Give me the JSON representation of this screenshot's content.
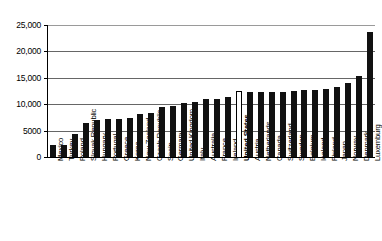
{
  "chart_data": {
    "type": "bar",
    "title": "",
    "subtitle": "",
    "xlabel": "",
    "ylabel": "",
    "ylim": [
      0,
      25000
    ],
    "yticks": [
      0,
      5000,
      10000,
      15000,
      20000,
      25000
    ],
    "ytick_labels": [
      "0",
      "5000",
      "10,000",
      "15,000",
      "20,000",
      "25,000"
    ],
    "grid": true,
    "legend": "none",
    "highlight_category": "United States",
    "highlight_style": "hollow-white-bar-with-black-outline",
    "bar_color": "#111111",
    "highlight_bar_color": "#ffffff",
    "categories": [
      "Mexico",
      "Turkey",
      "Poland",
      "Slovak Republic",
      "Hungary",
      "Portugal",
      "Greece",
      "Korea",
      "New Zealand",
      "Czech Republic",
      "Spain",
      "Germany",
      "United Kingdom",
      "Italy",
      "Australia",
      "France",
      "Ireland",
      "United States",
      "Austria",
      "Netherlands",
      "Canada",
      "Switzerland",
      "Sweden",
      "Belgium",
      "Iceland",
      "Finland",
      "Japan",
      "Norway",
      "Denmark",
      "Luxemburg"
    ],
    "values": [
      2200,
      2250,
      4400,
      6500,
      6950,
      7150,
      7200,
      7350,
      8200,
      8400,
      9550,
      9700,
      10300,
      10500,
      10900,
      11000,
      11400,
      12500,
      12250,
      12300,
      12350,
      12400,
      12500,
      12600,
      12750,
      12800,
      13300,
      14000,
      15300,
      23600
    ]
  }
}
